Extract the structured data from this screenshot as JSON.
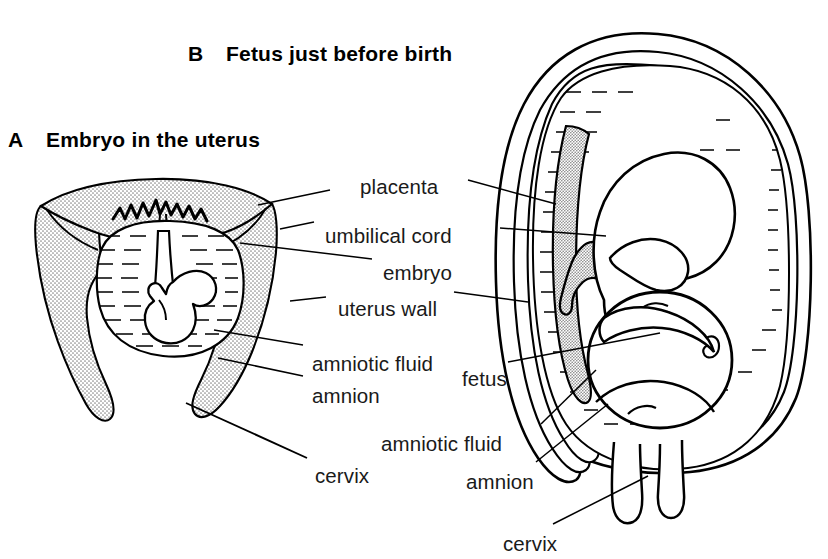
{
  "figure": {
    "background_color": "#ffffff",
    "ink_color": "#000000",
    "stipple_color": "#9a9a9a"
  },
  "panels": [
    {
      "letter": "A",
      "title": "Embryo in the uterus",
      "x": 8,
      "y": 128
    },
    {
      "letter": "B",
      "title": "Fetus just before birth",
      "x": 188,
      "y": 42
    }
  ],
  "labels": [
    {
      "name": "placenta",
      "text": "placenta",
      "x": 360,
      "y": 175,
      "align": "left"
    },
    {
      "name": "umbilical-cord",
      "text": "umbilical cord",
      "x": 325,
      "y": 224,
      "align": "left"
    },
    {
      "name": "embryo",
      "text": "embryo",
      "x": 383,
      "y": 261,
      "align": "left"
    },
    {
      "name": "uterus-wall",
      "text": "uterus wall",
      "x": 338,
      "y": 297,
      "align": "left"
    },
    {
      "name": "amniotic-fluid-a",
      "text": "amniotic fluid",
      "x": 312,
      "y": 352,
      "align": "left"
    },
    {
      "name": "amnion-a",
      "text": "amnion",
      "x": 312,
      "y": 384,
      "align": "left"
    },
    {
      "name": "cervix-a",
      "text": "cervix",
      "x": 315,
      "y": 464,
      "align": "left"
    },
    {
      "name": "fetus",
      "text": "fetus",
      "x": 462,
      "y": 367,
      "align": "left"
    },
    {
      "name": "amniotic-fluid-b",
      "text": "amniotic fluid",
      "x": 381,
      "y": 432,
      "align": "left"
    },
    {
      "name": "amnion-b",
      "text": "amnion",
      "x": 466,
      "y": 470,
      "align": "left"
    },
    {
      "name": "cervix-b",
      "text": "cervix",
      "x": 503,
      "y": 532,
      "align": "left"
    }
  ],
  "leader_lines": [
    {
      "name": "leader-placenta-left",
      "points": "330,190 258,205"
    },
    {
      "name": "leader-placenta-right",
      "points": "468,180 556,204"
    },
    {
      "name": "leader-umbilical-left",
      "points": "314,222 280,229"
    },
    {
      "name": "leader-umbilical-right",
      "points": "500,228 606,236"
    },
    {
      "name": "leader-embryo",
      "points": "372,259 240,243"
    },
    {
      "name": "leader-uterus-wall-left",
      "points": "326,297 290,301"
    },
    {
      "name": "leader-uterus-wall-right",
      "points": "454,292 528,302"
    },
    {
      "name": "leader-amniotic-fluid-a",
      "points": "303,345 214,330"
    },
    {
      "name": "leader-amnion-a",
      "points": "303,376 218,358"
    },
    {
      "name": "leader-cervix-a",
      "points": "307,458 186,403"
    },
    {
      "name": "leader-fetus",
      "points": "508,362 660,333"
    },
    {
      "name": "leader-amniotic-fluid-b",
      "points": "541,424 596,370"
    },
    {
      "name": "leader-amnion-b",
      "points": "536,462 608,404"
    },
    {
      "name": "leader-cervix-b",
      "points": "553,524 648,476"
    }
  ],
  "panel_a_parts": [
    "uterus-wall-stipple",
    "placenta-stipple",
    "chorionic-villi",
    "amnion-sac",
    "amniotic-fluid-hatch",
    "embryo-body",
    "umbilical-cord",
    "cervix-canal"
  ],
  "panel_b_parts": [
    "uterus-wall-outer",
    "amnion-layer",
    "amniotic-fluid-hatch",
    "placenta-stipple",
    "umbilical-cord-stipple",
    "fetus-head",
    "fetus-ear",
    "fetus-body",
    "fetus-arm",
    "fetus-leg",
    "cervix-canal"
  ]
}
